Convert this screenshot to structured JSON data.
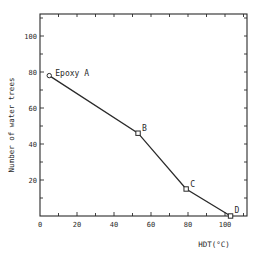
{
  "chart_data": {
    "type": "line",
    "title": "",
    "xlabel": "HDT(°C)",
    "ylabel": "Number of water trees",
    "xlim": [
      0,
      112
    ],
    "ylim": [
      0,
      112
    ],
    "x_ticks": [
      0,
      20,
      40,
      60,
      80,
      100
    ],
    "y_ticks": [
      20,
      40,
      60,
      80,
      100
    ],
    "grid": false,
    "legend": null,
    "series": [
      {
        "name": "Water trees vs HDT",
        "points": [
          {
            "label": "Epoxy A",
            "x": 5,
            "y": 78
          },
          {
            "label": "B",
            "x": 53,
            "y": 46
          },
          {
            "label": "C",
            "x": 79,
            "y": 15
          },
          {
            "label": "D",
            "x": 103,
            "y": 0
          }
        ]
      }
    ]
  },
  "colors": {
    "line": "#2a2a2a",
    "background": "#ffffff"
  }
}
